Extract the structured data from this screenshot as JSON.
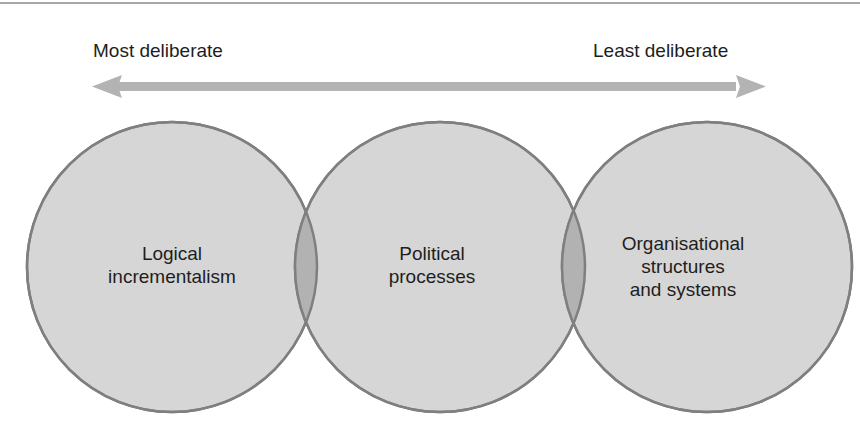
{
  "axis": {
    "left_label": "Most deliberate",
    "right_label": "Least deliberate",
    "arrow_color": "#b3b3b3"
  },
  "circles": [
    {
      "label_lines": [
        "Logical",
        "incrementalism"
      ],
      "cx": 172,
      "cy": 267,
      "r": 145
    },
    {
      "label_lines": [
        "Political",
        "processes"
      ],
      "cx": 440,
      "cy": 267,
      "r": 145
    },
    {
      "label_lines": [
        "Organisational",
        "structures",
        "and systems"
      ],
      "cx": 707,
      "cy": 267,
      "r": 145
    }
  ],
  "colors": {
    "circle_fill": "#d6d6d6",
    "circle_stroke": "#7f7f7f",
    "overlap_fill": "#b2b2b2"
  }
}
